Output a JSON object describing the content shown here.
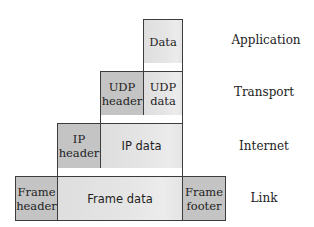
{
  "diagram": {
    "layers": [
      {
        "name": "Application",
        "blocks": [
          {
            "label": "Data",
            "kind": "data"
          }
        ]
      },
      {
        "name": "Transport",
        "blocks": [
          {
            "label": "UDP header",
            "kind": "header"
          },
          {
            "label": "UDP data",
            "kind": "data"
          }
        ]
      },
      {
        "name": "Internet",
        "blocks": [
          {
            "label": "IP header",
            "kind": "header"
          },
          {
            "label": "IP data",
            "kind": "data"
          }
        ]
      },
      {
        "name": "Link",
        "blocks": [
          {
            "label": "Frame header",
            "kind": "header"
          },
          {
            "label": "Frame data",
            "kind": "data"
          },
          {
            "label": "Frame footer",
            "kind": "footer"
          }
        ]
      }
    ],
    "labels": {
      "application": "Application",
      "transport": "Transport",
      "internet": "Internet",
      "link": "Link",
      "data": "Data",
      "udp_header_1": "UDP",
      "udp_header_2": "header",
      "udp_data_1": "UDP",
      "udp_data_2": "data",
      "ip_header_1": "IP",
      "ip_header_2": "header",
      "ip_data": "IP data",
      "frame_header_1": "Frame",
      "frame_header_2": "header",
      "frame_data": "Frame data",
      "frame_footer_1": "Frame",
      "frame_footer_2": "footer"
    },
    "colors": {
      "header_fill": "#c4c4c4",
      "data_fill": "#e4e4e4",
      "border": "#3c3c3c"
    }
  }
}
